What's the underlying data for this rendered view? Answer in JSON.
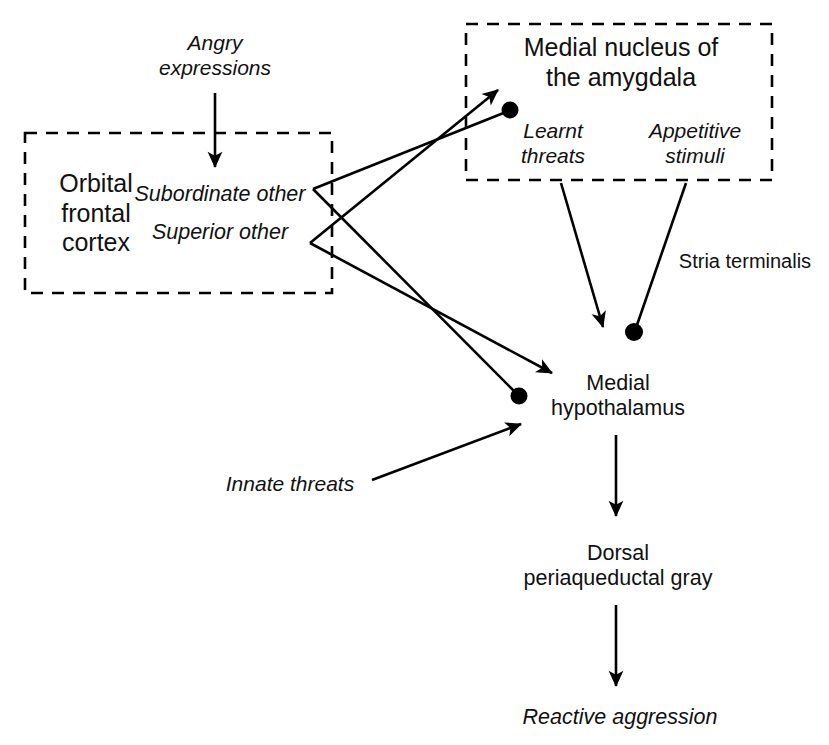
{
  "figure": {
    "type": "flow-diagram",
    "background_color": "#ffffff",
    "stroke_color": "#000000"
  },
  "boxes": [
    {
      "id": "orbital-frontal-cortex",
      "label": "Orbital\nfrontal\ncortex",
      "border_style": "dashed",
      "x": 25,
      "y": 133,
      "width": 307,
      "height": 160,
      "label_x": 96,
      "label_y": 213
    },
    {
      "id": "medial-nucleus-amygdala",
      "label": "Medial nucleus of\nthe amygdala",
      "border_style": "dashed",
      "x": 466,
      "y": 24,
      "width": 306,
      "height": 156,
      "label_x": 621,
      "label_y": 62
    }
  ],
  "nodes": [
    {
      "id": "angry-expressions",
      "label": "Angry\nexpressions",
      "style": "italic",
      "size": "input",
      "x": 215,
      "y": 56
    },
    {
      "id": "subordinate-other",
      "label": "Subordinate other",
      "style": "italic",
      "size": "struct",
      "x": 220,
      "y": 195
    },
    {
      "id": "superior-other",
      "label": "Superior other",
      "style": "italic",
      "size": "struct",
      "x": 220,
      "y": 233
    },
    {
      "id": "learnt-threats",
      "label": "Learnt\nthreats",
      "style": "italic",
      "size": "input",
      "x": 553,
      "y": 144
    },
    {
      "id": "appetitive-stimuli",
      "label": "Appetitive\nstimuli",
      "style": "italic",
      "size": "input",
      "x": 695,
      "y": 144
    },
    {
      "id": "stria-terminalis",
      "label": "Stria terminalis",
      "style": "roman",
      "size": "tract",
      "x": 745,
      "y": 262
    },
    {
      "id": "innate-threats",
      "label": "Innate threats",
      "style": "italic",
      "size": "input",
      "x": 290,
      "y": 484
    },
    {
      "id": "medial-hypothalamus",
      "label": "Medial\nhypothalamus",
      "style": "roman",
      "size": "struct",
      "x": 618,
      "y": 396
    },
    {
      "id": "dorsal-pag",
      "label": "Dorsal\nperiaqueductal gray",
      "style": "roman",
      "size": "struct",
      "x": 618,
      "y": 566
    },
    {
      "id": "reactive-aggression",
      "label": "Reactive aggression",
      "style": "italic",
      "size": "struct",
      "x": 620,
      "y": 718
    }
  ],
  "connections": [
    {
      "id": "angry-to-subordinate",
      "from": "angry-expressions",
      "to": "subordinate-other",
      "ending": "arrow"
    },
    {
      "id": "superior-to-amygdala",
      "from": "superior-other",
      "to": "medial-nucleus-amygdala",
      "ending": "arrow"
    },
    {
      "id": "subordinate-to-amygdala",
      "from": "subordinate-other",
      "to": "medial-nucleus-amygdala",
      "ending": "dot"
    },
    {
      "id": "superior-to-hypothalamus",
      "from": "superior-other",
      "to": "medial-hypothalamus",
      "ending": "arrow"
    },
    {
      "id": "subordinate-to-hypothalamus",
      "from": "subordinate-other",
      "to": "medial-hypothalamus",
      "ending": "dot"
    },
    {
      "id": "learnt-threats-to-hypothalamus",
      "from": "learnt-threats",
      "to": "medial-hypothalamus",
      "ending": "arrow"
    },
    {
      "id": "appetitive-to-hypothalamus",
      "from": "appetitive-stimuli",
      "to": "medial-hypothalamus",
      "ending": "dot"
    },
    {
      "id": "innate-threats-to-hypothalamus",
      "from": "innate-threats",
      "to": "medial-hypothalamus",
      "ending": "arrow"
    },
    {
      "id": "hypothalamus-to-pag",
      "from": "medial-hypothalamus",
      "to": "dorsal-pag",
      "ending": "arrow"
    },
    {
      "id": "pag-to-aggression",
      "from": "dorsal-pag",
      "to": "reactive-aggression",
      "ending": "arrow"
    }
  ]
}
